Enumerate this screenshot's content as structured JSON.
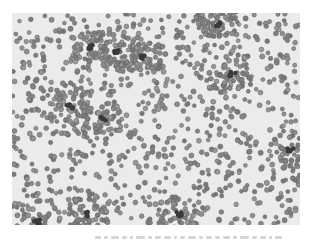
{
  "image": {
    "description": "Grayscale light-microscope photograph of a dense field of small round cells (blood smear / particle suspension) with scattered darker clumps",
    "background_color": "#ebebeb",
    "cell_color": "#8a8a8a",
    "cell_edge_color": "#5f5f5f",
    "clump_color": "#3a3a3a",
    "cell_count_approx": 1400,
    "clumps": [
      {
        "x": 118,
        "y": 52
      },
      {
        "x": 143,
        "y": 58
      },
      {
        "x": 217,
        "y": 24
      },
      {
        "x": 232,
        "y": 74
      },
      {
        "x": 70,
        "y": 107
      },
      {
        "x": 103,
        "y": 118
      },
      {
        "x": 178,
        "y": 214
      },
      {
        "x": 290,
        "y": 150
      },
      {
        "x": 37,
        "y": 222
      },
      {
        "x": 88,
        "y": 214
      },
      {
        "x": 90,
        "y": 47
      }
    ]
  },
  "caption": {
    "text": "",
    "note": "faint illegible caption strip below the image"
  }
}
